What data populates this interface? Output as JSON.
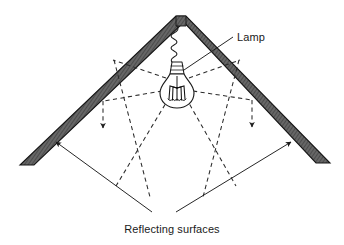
{
  "figure": {
    "background_color": "#ffffff",
    "labels": {
      "lamp": "Lamp",
      "reflecting_surfaces": "Reflecting surfaces"
    },
    "colors": {
      "roof_fill": "#5e5e5e",
      "roof_hatch": "#3a3a3a",
      "roof_outline": "#1a1a1a",
      "ray_stroke": "#2b2b2b",
      "leader_stroke": "#1a1a1a",
      "bulb_outline": "#1a1a1a",
      "text": "#1a1a1a"
    },
    "elements": {
      "roof_left_name": "left reflecting surface",
      "roof_right_name": "right reflecting surface",
      "apex_name": "roof apex",
      "lamp_name": "incandescent lamp",
      "cord_name": "lamp cord",
      "rays_name": "light rays",
      "reflected_rays_name": "reflected downward rays"
    },
    "geometry": {
      "apex": [
        177,
        16
      ],
      "left_eave": [
        20,
        165
      ],
      "right_eave": [
        330,
        163
      ],
      "bulb_center": [
        177,
        85
      ],
      "roof_thickness": 13
    },
    "ray_lines": [
      {
        "name": "ray-up-left",
        "from": [
          166,
          78
        ],
        "to": [
          112,
          61
        ]
      },
      {
        "name": "ray-up-right",
        "from": [
          189,
          78
        ],
        "to": [
          240,
          61
        ]
      },
      {
        "name": "ray-left-horizontal",
        "from": [
          163,
          90
        ],
        "to": [
          103,
          100
        ]
      },
      {
        "name": "ray-right-horizontal",
        "from": [
          192,
          90
        ],
        "to": [
          252,
          99
        ]
      },
      {
        "name": "ray-down-left-long",
        "from": [
          168,
          97
        ],
        "to": [
          115,
          185
        ]
      },
      {
        "name": "ray-down-right-long",
        "from": [
          187,
          97
        ],
        "to": [
          237,
          185
        ]
      },
      {
        "name": "reflect-left-from-roof",
        "from": [
          112,
          61
        ],
        "to": [
          148,
          196
        ]
      },
      {
        "name": "reflect-right-from-roof",
        "from": [
          240,
          61
        ],
        "to": [
          205,
          196
        ]
      },
      {
        "name": "reflect-left-vertical",
        "from": [
          103,
          100
        ],
        "to": [
          103,
          130
        ]
      },
      {
        "name": "reflect-right-vertical",
        "from": [
          252,
          99
        ],
        "to": [
          252,
          129
        ]
      }
    ],
    "leader_lines": [
      {
        "name": "lamp-leader",
        "from": [
          232,
          36
        ],
        "to": [
          183,
          70
        ]
      },
      {
        "name": "caption-leader-left",
        "from": [
          152,
          213
        ],
        "to": [
          57,
          143
        ]
      },
      {
        "name": "caption-leader-right",
        "from": [
          177,
          213
        ],
        "to": [
          290,
          143
        ]
      }
    ]
  }
}
